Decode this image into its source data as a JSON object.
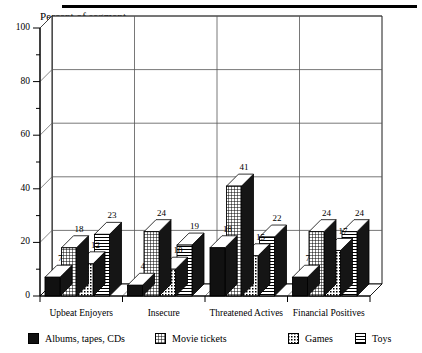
{
  "axis_title": "Percent of segment",
  "y_axis": {
    "ticks": [
      "0",
      "20",
      "40",
      "60",
      "80",
      "100"
    ],
    "min": 0,
    "max": 100,
    "minor_step": 10
  },
  "categories": [
    "Upbeat Enjoyers",
    "Insecure",
    "Threatened Actives",
    "Financial Positives"
  ],
  "legend": [
    {
      "label": "Albums, tapes, CDs",
      "pattern": "solid-black"
    },
    {
      "label": "Movie tickets",
      "pattern": "grid"
    },
    {
      "label": "Games",
      "pattern": "dotted"
    },
    {
      "label": "Toys",
      "pattern": "horizontal-lines"
    }
  ],
  "value_labels": {
    "g0": [
      "7",
      "18",
      "12",
      "23"
    ],
    "g1": [
      "4",
      "24",
      "10",
      "19"
    ],
    "g2": [
      "18",
      "41",
      "15",
      "22"
    ],
    "g3": [
      "7",
      "24",
      "17",
      "24"
    ]
  },
  "colors": {
    "ink": "#000000",
    "grid": "#808080",
    "wall": "#ffffff",
    "bar_top": "#ffffff",
    "bar_side": "#1a1a1a"
  },
  "chart_data": {
    "type": "bar",
    "title": "",
    "subtitle": "",
    "xlabel": "",
    "ylabel": "Percent of segment",
    "ylim": [
      0,
      100
    ],
    "yticks": [
      0,
      20,
      40,
      60,
      80,
      100
    ],
    "grid": true,
    "legend_position": "bottom",
    "style": "3d-clustered-column",
    "categories": [
      "Upbeat Enjoyers",
      "Insecure",
      "Threatened Actives",
      "Financial Positives"
    ],
    "series": [
      {
        "name": "Albums, tapes, CDs",
        "values": [
          7,
          4,
          18,
          7
        ]
      },
      {
        "name": "Movie tickets",
        "values": [
          18,
          24,
          41,
          24
        ]
      },
      {
        "name": "Games",
        "values": [
          12,
          10,
          15,
          17
        ]
      },
      {
        "name": "Toys",
        "values": [
          23,
          19,
          22,
          24
        ]
      }
    ]
  }
}
